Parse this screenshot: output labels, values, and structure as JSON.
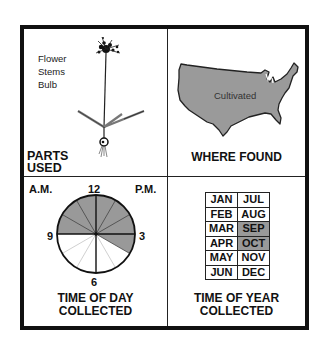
{
  "panels": {
    "parts_used": {
      "parts": [
        "Flower",
        "Stems",
        "Bulb"
      ],
      "caption_line1": "PARTS",
      "caption_line2": "USED"
    },
    "where_found": {
      "map_label": "Cultivated",
      "caption": "WHERE FOUND",
      "map_fill": "#9a9a9a"
    },
    "time_of_day": {
      "am_label": "A.M.",
      "pm_label": "P.M.",
      "hour_12": "12",
      "hour_3": "3",
      "hour_6": "6",
      "hour_9": "9",
      "shaded_range": "9 to 4",
      "shade_color": "#999999",
      "caption_line1": "TIME OF DAY",
      "caption_line2": "COLLECTED"
    },
    "time_of_year": {
      "months": [
        {
          "left": "JAN",
          "right": "JUL",
          "left_on": false,
          "right_on": false
        },
        {
          "left": "FEB",
          "right": "AUG",
          "left_on": false,
          "right_on": false
        },
        {
          "left": "MAR",
          "right": "SEP",
          "left_on": false,
          "right_on": true
        },
        {
          "left": "APR",
          "right": "OCT",
          "left_on": false,
          "right_on": true
        },
        {
          "left": "MAY",
          "right": "NOV",
          "left_on": false,
          "right_on": false
        },
        {
          "left": "JUN",
          "right": "DEC",
          "left_on": false,
          "right_on": false
        }
      ],
      "caption_line1": "TIME OF YEAR",
      "caption_line2": "COLLECTED"
    }
  }
}
